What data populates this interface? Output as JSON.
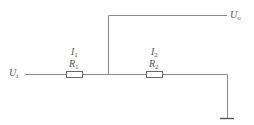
{
  "diagram": {
    "type": "circuit",
    "colors": {
      "wire": "#8a8a8a",
      "text": "#555555",
      "background": "#ffffff"
    },
    "labels": {
      "input": {
        "main": "U",
        "sub": "i"
      },
      "output": {
        "main": "U",
        "sub": "o"
      },
      "i1": {
        "main": "I",
        "sub": "1"
      },
      "r1": {
        "main": "R",
        "sub": "1"
      },
      "i2": {
        "main": "I",
        "sub": "2"
      },
      "r2": {
        "main": "R",
        "sub": "2"
      }
    },
    "components": [
      {
        "id": "R1",
        "kind": "resistor",
        "current": "I1"
      },
      {
        "id": "R2",
        "kind": "resistor",
        "current": "I2"
      },
      {
        "id": "GND",
        "kind": "ground"
      }
    ]
  }
}
